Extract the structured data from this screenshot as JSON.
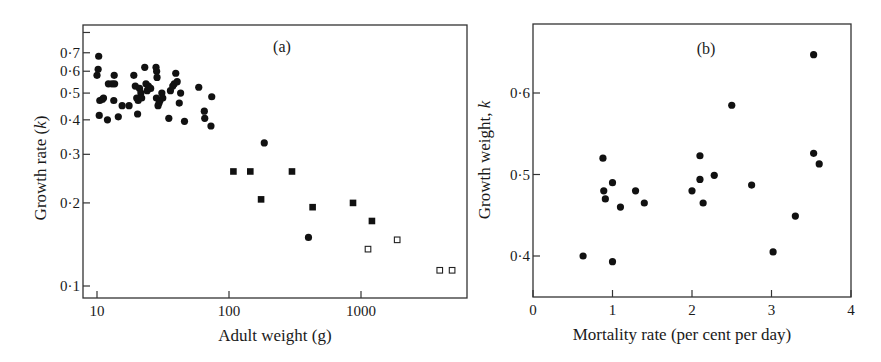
{
  "chart_data": [
    {
      "panel": "a",
      "type": "scatter",
      "title": "(a)",
      "xlabel": "Adult weight (g)",
      "ylabel": "Growth rate (k)",
      "xscale": "log",
      "yscale": "log",
      "xlim": [
        8,
        5500
      ],
      "ylim": [
        0.1,
        0.85
      ],
      "xticks": [
        10,
        100,
        1000
      ],
      "xtick_labels": [
        "10",
        "100",
        "1000"
      ],
      "yticks": [
        0.1,
        0.2,
        0.3,
        0.4,
        0.5,
        0.6,
        0.7
      ],
      "ytick_labels": [
        "0·1",
        "0·2",
        "0·3",
        "0·4",
        "0·5",
        "0·6",
        "0·7"
      ],
      "grid": false,
      "legend": null,
      "series": [
        {
          "name": "filled circles",
          "marker": "circle-filled",
          "points": [
            [
              10,
              0.58
            ],
            [
              10.2,
              0.61
            ],
            [
              10.3,
              0.68
            ],
            [
              10.5,
              0.47
            ],
            [
              10.4,
              0.415
            ],
            [
              11,
              0.475
            ],
            [
              11.2,
              0.48
            ],
            [
              12,
              0.4
            ],
            [
              12.2,
              0.54
            ],
            [
              13,
              0.54
            ],
            [
              13.5,
              0.58
            ],
            [
              13.6,
              0.54
            ],
            [
              13.4,
              0.47
            ],
            [
              14.5,
              0.41
            ],
            [
              15.5,
              0.45
            ],
            [
              17.5,
              0.45
            ],
            [
              19,
              0.58
            ],
            [
              19.5,
              0.53
            ],
            [
              20,
              0.48
            ],
            [
              20.3,
              0.42
            ],
            [
              20.5,
              0.47
            ],
            [
              21,
              0.52
            ],
            [
              21.5,
              0.5
            ],
            [
              21.8,
              0.48
            ],
            [
              23,
              0.62
            ],
            [
              23.5,
              0.54
            ],
            [
              24,
              0.51
            ],
            [
              24.5,
              0.53
            ],
            [
              25.5,
              0.52
            ],
            [
              28,
              0.62
            ],
            [
              28.3,
              0.6
            ],
            [
              28.5,
              0.57
            ],
            [
              28.2,
              0.48
            ],
            [
              29,
              0.45
            ],
            [
              29.5,
              0.46
            ],
            [
              30,
              0.47
            ],
            [
              31,
              0.5
            ],
            [
              31.5,
              0.48
            ],
            [
              35,
              0.405
            ],
            [
              36,
              0.51
            ],
            [
              37.5,
              0.53
            ],
            [
              38.5,
              0.54
            ],
            [
              39.5,
              0.59
            ],
            [
              40.5,
              0.55
            ],
            [
              42,
              0.46
            ],
            [
              43,
              0.5
            ],
            [
              46,
              0.395
            ],
            [
              59,
              0.525
            ],
            [
              65,
              0.43
            ],
            [
              65.5,
              0.405
            ],
            [
              73,
              0.38
            ],
            [
              74,
              0.485
            ],
            [
              185,
              0.33
            ],
            [
              400,
              0.15
            ]
          ]
        },
        {
          "name": "filled squares",
          "marker": "square-filled",
          "points": [
            [
              108,
              0.26
            ],
            [
              145,
              0.26
            ],
            [
              175,
              0.206
            ],
            [
              300,
              0.26
            ],
            [
              430,
              0.193
            ],
            [
              870,
              0.2
            ],
            [
              1210,
              0.172
            ]
          ]
        },
        {
          "name": "open squares",
          "marker": "square-open",
          "points": [
            [
              1130,
              0.136
            ],
            [
              1880,
              0.147
            ],
            [
              3950,
              0.114
            ],
            [
              4900,
              0.114
            ]
          ]
        }
      ]
    },
    {
      "panel": "b",
      "type": "scatter",
      "title": "(b)",
      "xlabel": "Mortality rate (per cent per day)",
      "ylabel": "Growth weight, k",
      "xscale": "linear",
      "yscale": "linear",
      "xlim": [
        0,
        4
      ],
      "ylim": [
        0.365,
        0.685
      ],
      "xticks": [
        0,
        1,
        2,
        3,
        4
      ],
      "xtick_labels": [
        "0",
        "1",
        "2",
        "3",
        "4"
      ],
      "yticks": [
        0.4,
        0.5,
        0.6
      ],
      "ytick_labels": [
        "0·4",
        "0·5",
        "0·6"
      ],
      "grid": false,
      "legend": null,
      "series": [
        {
          "name": "filled circles",
          "marker": "circle-filled",
          "points": [
            [
              0.63,
              0.4
            ],
            [
              1.0,
              0.393
            ],
            [
              0.88,
              0.52
            ],
            [
              0.89,
              0.48
            ],
            [
              0.91,
              0.47
            ],
            [
              1.0,
              0.49
            ],
            [
              1.1,
              0.46
            ],
            [
              1.29,
              0.48
            ],
            [
              1.4,
              0.465
            ],
            [
              2.0,
              0.48
            ],
            [
              2.1,
              0.523
            ],
            [
              2.1,
              0.494
            ],
            [
              2.14,
              0.465
            ],
            [
              2.28,
              0.499
            ],
            [
              2.5,
              0.585
            ],
            [
              2.75,
              0.487
            ],
            [
              3.02,
              0.405
            ],
            [
              3.3,
              0.449
            ],
            [
              3.53,
              0.647
            ],
            [
              3.53,
              0.526
            ],
            [
              3.6,
              0.513
            ]
          ]
        }
      ]
    }
  ]
}
